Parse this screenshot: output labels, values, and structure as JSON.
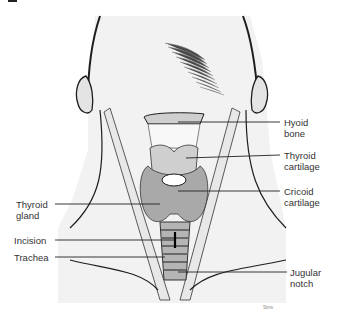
{
  "figure": {
    "colors": {
      "background": "#ffffff",
      "skin": "#f2f2f2",
      "outline": "#1e1e1e",
      "cartilage": "#cfcfcf",
      "gland": "#a9a9a9",
      "label_text": "#333333"
    },
    "labels": {
      "hyoid": {
        "line1": "Hyoid",
        "line2": "bone"
      },
      "thyroid_cartilage": {
        "line1": "Thyroid",
        "line2": "cartilage"
      },
      "cricoid": {
        "line1": "Cricoid",
        "line2": "cartilage"
      },
      "thyroid_gland": {
        "line1": "Thyroid",
        "line2": "gland"
      },
      "incision": {
        "line1": "Incision"
      },
      "trachea": {
        "line1": "Trachea"
      },
      "jugular": {
        "line1": "Jugular",
        "line2": "notch"
      }
    },
    "signature": "Sims"
  }
}
